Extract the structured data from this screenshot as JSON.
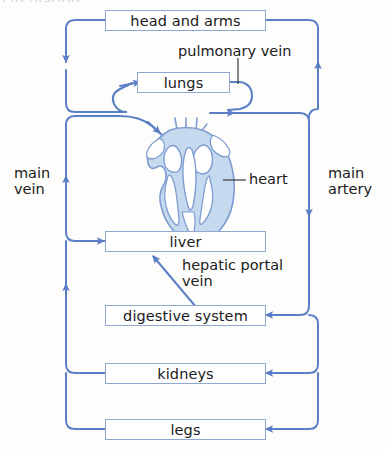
{
  "figure": {
    "title_fragment": "circulation",
    "type": "double-circulation-flow-diagram",
    "colors": {
      "vessel": "#5b7fc4",
      "box_border": "#8fa8cf",
      "heart_fill": "#c5d9ef",
      "heart_outline": "#7f9dd0",
      "text": "#1b1b1b",
      "background": "#fdfdfc"
    }
  },
  "organs": [
    {
      "id": "head-and-arms",
      "label": "head and arms"
    },
    {
      "id": "lungs",
      "label": "lungs"
    },
    {
      "id": "liver",
      "label": "liver"
    },
    {
      "id": "digestive-system",
      "label": "digestive system"
    },
    {
      "id": "kidneys",
      "label": "kidneys"
    },
    {
      "id": "legs",
      "label": "legs"
    }
  ],
  "labels": {
    "pulmonary_vein": "pulmonary vein",
    "heart": "heart",
    "main_vein": "main\nvein",
    "main_artery": "main\nartery",
    "hepatic_portal_vein": "hepatic portal\nvein"
  }
}
